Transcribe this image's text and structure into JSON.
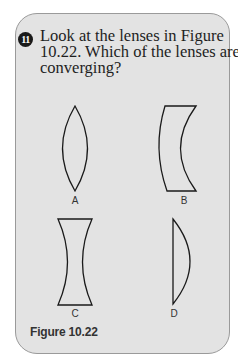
{
  "question": {
    "number": "11",
    "lines": [
      "Look at the lenses in Figure",
      "10.22. Which of the lenses are",
      "converging?"
    ]
  },
  "figure": {
    "caption": "Figure 10.22",
    "lenses": [
      {
        "label": "A",
        "shape": "biconvex"
      },
      {
        "label": "B",
        "shape": "concave-convex (meniscus)"
      },
      {
        "label": "C",
        "shape": "biconcave"
      },
      {
        "label": "D",
        "shape": "plano-convex"
      }
    ]
  },
  "colors": {
    "card_background": "#e3e3e3",
    "card_border": "#9a9a9a",
    "text": "#1e1e1e",
    "caption": "#333333"
  }
}
